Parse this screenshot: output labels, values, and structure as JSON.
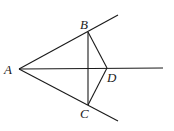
{
  "diagram": {
    "points": {
      "A": {
        "label": "A",
        "x": 19,
        "y": 69
      },
      "B": {
        "label": "B",
        "x": 88,
        "y": 32
      },
      "C": {
        "label": "C",
        "x": 88,
        "y": 105
      },
      "D": {
        "label": "D",
        "x": 107,
        "y": 68
      }
    },
    "rays": [
      {
        "from": "A",
        "through": "B",
        "end": [
          118,
          15
        ]
      },
      {
        "from": "A",
        "through": "D",
        "end": [
          163,
          68
        ]
      },
      {
        "from": "A",
        "through": "C",
        "end": [
          118,
          121
        ]
      }
    ],
    "segments": [
      [
        "B",
        "C"
      ],
      [
        "B",
        "D"
      ],
      [
        "C",
        "D"
      ]
    ],
    "labels": {
      "A": "A",
      "B": "B",
      "C": "C",
      "D": "D"
    },
    "stroke_color": "#1a1a1a"
  }
}
